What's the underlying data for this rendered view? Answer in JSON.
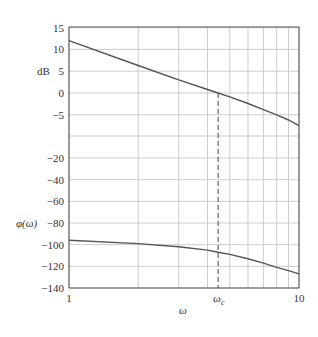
{
  "chart_data": [
    {
      "type": "line",
      "title": "",
      "xlabel": "ω",
      "ylabel": "dB",
      "xscale": "log",
      "xlim": [
        1,
        10
      ],
      "ylim": [
        -10,
        15
      ],
      "yticks": [
        15,
        10,
        5,
        0,
        -5
      ],
      "grid": true,
      "series": [
        {
          "name": "magnitude",
          "x": [
            1,
            2,
            3,
            4,
            4.45,
            5,
            6,
            7,
            8,
            9,
            10
          ],
          "values": [
            12,
            6.3,
            3.0,
            0.8,
            0,
            -0.9,
            -2.4,
            -3.8,
            -5.0,
            -6.2,
            -7.5
          ]
        }
      ]
    },
    {
      "type": "line",
      "title": "",
      "xlabel": "ω",
      "ylabel": "φ(ω)",
      "xscale": "log",
      "xlim": [
        1,
        10
      ],
      "ylim": [
        -140,
        -20
      ],
      "yticks": [
        -20,
        -40,
        -60,
        -80,
        -100,
        -120,
        -140
      ],
      "grid": true,
      "series": [
        {
          "name": "phase",
          "x": [
            1,
            2,
            3,
            4,
            4.45,
            5,
            6,
            7,
            8,
            9,
            10
          ],
          "values": [
            -96,
            -99,
            -102,
            -105,
            -107,
            -109,
            -113,
            -117,
            -121,
            -124,
            -127
          ]
        }
      ]
    }
  ],
  "axes": {
    "mag_ylabel": "dB",
    "phase_ylabel": "φ(ω)",
    "xlabel": "ω",
    "x_ticks": [
      "1",
      "10"
    ],
    "crossover_label": "ω",
    "crossover_sub": "c",
    "crossover_value": 4.45,
    "mag_tick_labels": [
      "15",
      "10",
      "5",
      "0",
      "−5"
    ],
    "phase_tick_labels": [
      "−20",
      "−40",
      "−60",
      "−80",
      "−100",
      "−120",
      "−140"
    ]
  },
  "colors": {
    "curve": "#555555",
    "grid": "#cccccc",
    "axis": "#555555",
    "text": "#333333"
  }
}
